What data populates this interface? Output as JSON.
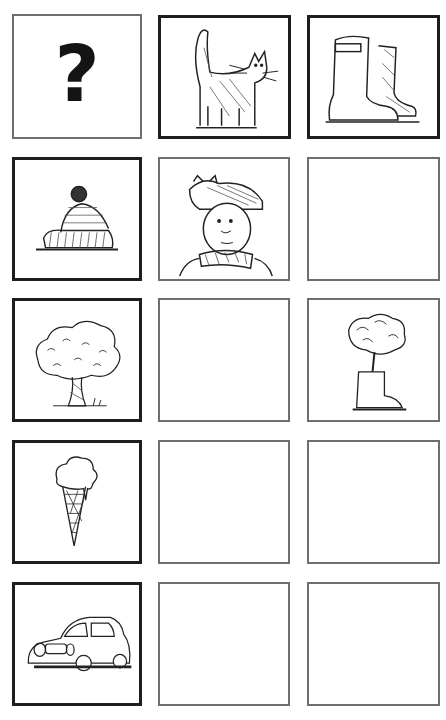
{
  "worksheet": {
    "grid": {
      "rows": 5,
      "columns": 3,
      "cells": [
        [
          {
            "type": "symbol",
            "content": "?",
            "icon": "question-mark-icon"
          },
          {
            "type": "picture",
            "icon": "cat-icon",
            "label": "cat"
          },
          {
            "type": "picture",
            "icon": "boots-icon",
            "label": "boots"
          }
        ],
        [
          {
            "type": "picture",
            "icon": "hat-icon",
            "label": "hat"
          },
          {
            "type": "picture",
            "icon": "person-with-cat-hat-icon",
            "label": "person with cat on hat"
          },
          {
            "type": "empty"
          }
        ],
        [
          {
            "type": "picture",
            "icon": "tree-icon",
            "label": "tree"
          },
          {
            "type": "empty"
          },
          {
            "type": "picture",
            "icon": "tree-in-boot-icon",
            "label": "tree in boot"
          }
        ],
        [
          {
            "type": "picture",
            "icon": "ice-cream-icon",
            "label": "ice cream"
          },
          {
            "type": "empty"
          },
          {
            "type": "empty"
          }
        ],
        [
          {
            "type": "picture",
            "icon": "car-icon",
            "label": "car"
          },
          {
            "type": "empty"
          },
          {
            "type": "empty"
          }
        ]
      ]
    },
    "colors": {
      "thick_border": "#1e1e1e",
      "thin_border": "#6e6e6e",
      "ink": "#141414",
      "background": "#ffffff"
    }
  }
}
